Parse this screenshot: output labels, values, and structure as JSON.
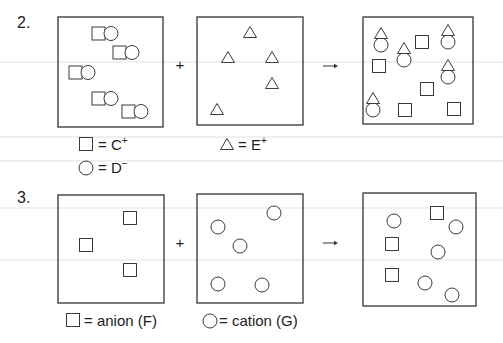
{
  "colors": {
    "ink": "#333333",
    "background": "#ffffff",
    "scanline": "#e2e2e2"
  },
  "scanlines": [
    62,
    137,
    161,
    208,
    260
  ],
  "problems": [
    {
      "number": "2.",
      "number_pos": [
        17,
        28
      ],
      "plus": {
        "label": "+",
        "pos": [
          180,
          70
        ]
      },
      "arrow": {
        "label": "→",
        "x1": 323,
        "x2": 338,
        "y": 66
      },
      "boxes": [
        {
          "name": "reactant-box-1",
          "rect": [
            58,
            17,
            105,
            110
          ],
          "items": [
            {
              "type": "pair",
              "x": 92,
              "y": 27
            },
            {
              "type": "pair",
              "x": 113,
              "y": 46
            },
            {
              "type": "pair",
              "x": 69,
              "y": 66
            },
            {
              "type": "pair",
              "x": 92,
              "y": 92
            },
            {
              "type": "pair",
              "x": 122,
              "y": 105
            }
          ]
        },
        {
          "name": "reactant-box-2",
          "rect": [
            197,
            17,
            106,
            108
          ],
          "items": [
            {
              "type": "triangle",
              "x": 250,
              "y": 32
            },
            {
              "type": "triangle",
              "x": 228,
              "y": 57
            },
            {
              "type": "triangle",
              "x": 272,
              "y": 57
            },
            {
              "type": "triangle",
              "x": 272,
              "y": 83
            },
            {
              "type": "triangle",
              "x": 217,
              "y": 109
            }
          ]
        },
        {
          "name": "product-box",
          "rect": [
            363,
            17,
            110,
            107
          ],
          "items": [
            {
              "type": "tri-circle",
              "x": 381,
              "y": 33
            },
            {
              "type": "tri-circle",
              "x": 404,
              "y": 48
            },
            {
              "type": "square",
              "x": 422,
              "y": 42
            },
            {
              "type": "tri-circle",
              "x": 448,
              "y": 30
            },
            {
              "type": "square",
              "x": 379,
              "y": 66
            },
            {
              "type": "tri-circle",
              "x": 448,
              "y": 65
            },
            {
              "type": "square",
              "x": 427,
              "y": 89
            },
            {
              "type": "tri-circle",
              "x": 373,
              "y": 98
            },
            {
              "type": "square",
              "x": 405,
              "y": 110
            },
            {
              "type": "square",
              "x": 454,
              "y": 109
            }
          ]
        }
      ],
      "legends": [
        {
          "icon": "square",
          "icon_pos": [
            86,
            144
          ],
          "text": "= C",
          "sup": "+",
          "text_pos": [
            98,
            150
          ]
        },
        {
          "icon": "circle",
          "icon_pos": [
            86,
            168
          ],
          "text": "= D",
          "sup": "−",
          "text_pos": [
            98,
            173
          ]
        },
        {
          "icon": "triangle",
          "icon_pos": [
            227,
            144
          ],
          "text": "= E",
          "sup": "+",
          "text_pos": [
            238,
            150
          ]
        }
      ]
    },
    {
      "number": "3.",
      "number_pos": [
        17,
        203
      ],
      "plus": {
        "label": "+",
        "pos": [
          180,
          248
        ]
      },
      "arrow": {
        "label": "→",
        "x1": 323,
        "x2": 338,
        "y": 243
      },
      "boxes": [
        {
          "name": "reactant-box-1",
          "rect": [
            58,
            195,
            106,
            108
          ],
          "items": [
            {
              "type": "square",
              "x": 130,
              "y": 218
            },
            {
              "type": "square",
              "x": 86,
              "y": 245
            },
            {
              "type": "square",
              "x": 130,
              "y": 270
            }
          ]
        },
        {
          "name": "reactant-box-2",
          "rect": [
            197,
            194,
            106,
            109
          ],
          "items": [
            {
              "type": "circle",
              "x": 274,
              "y": 213
            },
            {
              "type": "circle",
              "x": 218,
              "y": 227
            },
            {
              "type": "circle",
              "x": 240,
              "y": 246
            },
            {
              "type": "circle",
              "x": 218,
              "y": 284
            },
            {
              "type": "circle",
              "x": 262,
              "y": 285
            }
          ]
        },
        {
          "name": "product-box",
          "rect": [
            363,
            193,
            113,
            113
          ],
          "items": [
            {
              "type": "circle",
              "x": 394,
              "y": 221
            },
            {
              "type": "square",
              "x": 437,
              "y": 213
            },
            {
              "type": "circle",
              "x": 456,
              "y": 227
            },
            {
              "type": "square",
              "x": 392,
              "y": 244
            },
            {
              "type": "circle",
              "x": 438,
              "y": 252
            },
            {
              "type": "square",
              "x": 392,
              "y": 275
            },
            {
              "type": "circle",
              "x": 425,
              "y": 283
            },
            {
              "type": "circle",
              "x": 452,
              "y": 295
            }
          ]
        }
      ],
      "legends": [
        {
          "icon": "square",
          "icon_pos": [
            73,
            320
          ],
          "text": "= anion (F)",
          "sup": "",
          "text_pos": [
            84,
            326
          ]
        },
        {
          "icon": "circle",
          "icon_pos": [
            210,
            321
          ],
          "text": "= cation (G)",
          "sup": "",
          "text_pos": [
            219,
            326
          ]
        }
      ]
    }
  ]
}
